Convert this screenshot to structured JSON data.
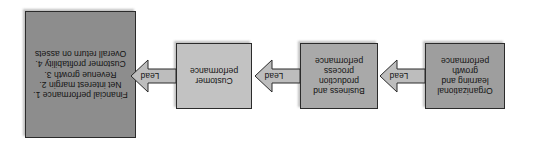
{
  "diagram": {
    "orientation_note": "rendered rotated 180 degrees",
    "background_color": "#ffffff",
    "nodes": [
      {
        "id": "learning",
        "label": "Organizational learning and growth performance",
        "fill": "#9e9e9e",
        "border": "#2b2b2b"
      },
      {
        "id": "process",
        "label": "Business and production process performance",
        "fill": "#a9a9a9",
        "border": "#2b2b2b"
      },
      {
        "id": "customer",
        "label": "Customer performance",
        "fill": "#c2c2c2",
        "border": "#2b2b2b"
      },
      {
        "id": "financial",
        "label": "Financial performance 1. Net interest margin 2. Revenue growth 3. Customer profitability 4. Overall return on assets",
        "fill": "#8d8d8d",
        "border": "#2b2b2b"
      }
    ],
    "arrows": [
      {
        "id": "arrow-1",
        "label": "Lead",
        "from": "learning",
        "to": "process",
        "fill": "#bdbdbd"
      },
      {
        "id": "arrow-2",
        "label": "Lead",
        "from": "process",
        "to": "customer",
        "fill": "#bdbdbd"
      },
      {
        "id": "arrow-3",
        "label": "Lead",
        "from": "customer",
        "to": "financial",
        "fill": "#bdbdbd"
      }
    ]
  }
}
